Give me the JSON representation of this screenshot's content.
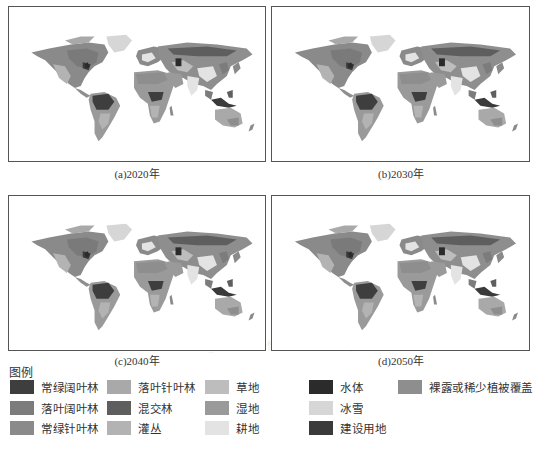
{
  "figure": {
    "panels": [
      {
        "id": "a",
        "caption": "(a)2020年"
      },
      {
        "id": "b",
        "caption": "(b)2030年"
      },
      {
        "id": "c",
        "caption": "(c)2040年"
      },
      {
        "id": "d",
        "caption": "(d)2050年"
      }
    ],
    "legend": {
      "title": "图例",
      "items": [
        {
          "label": "常绿阔叶林",
          "color": "#3e3e3e"
        },
        {
          "label": "落叶阔叶林",
          "color": "#7c7c7c"
        },
        {
          "label": "常绿针叶林",
          "color": "#8a8a8a"
        },
        {
          "label": "落叶针叶林",
          "color": "#a9a9a9"
        },
        {
          "label": "混交林",
          "color": "#5e5e5e"
        },
        {
          "label": "灌丛",
          "color": "#b3b3b3"
        },
        {
          "label": "草地",
          "color": "#bdbdbd"
        },
        {
          "label": "湿地",
          "color": "#9a9a9a"
        },
        {
          "label": "耕地",
          "color": "#e3e3e3"
        },
        {
          "label": "水体",
          "color": "#2b2b2b"
        },
        {
          "label": "冰雪",
          "color": "#d6d6d6"
        },
        {
          "label": "建设用地",
          "color": "#3a3a3a"
        },
        {
          "label": "裸露或稀少植被覆盖",
          "color": "#8e8e8e"
        }
      ]
    }
  },
  "bleed_through_text": [
    "S.1  SSP2_RCP4.5 情景下土地利用/覆盖变化模拟（1）",
    "…"
  ]
}
